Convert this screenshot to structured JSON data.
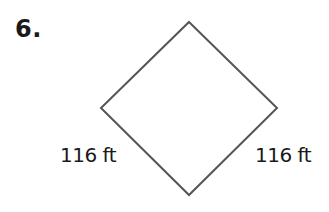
{
  "problem": {
    "number_label": "6."
  },
  "figure": {
    "shape": "square (rotated, diamond orientation)",
    "stroke_color": "#555555",
    "vertices": {
      "top": [
        189,
        22
      ],
      "right": [
        277,
        108
      ],
      "bottom": [
        189,
        195
      ],
      "left": [
        101,
        108
      ]
    },
    "labels": {
      "bottom_left_side": "116 ft",
      "bottom_right_side": "116 ft"
    }
  }
}
